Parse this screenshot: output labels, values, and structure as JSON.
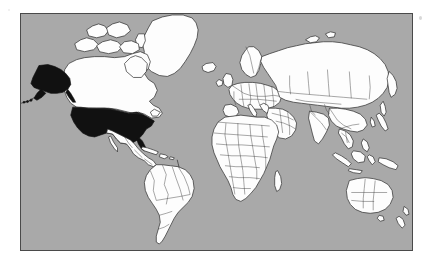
{
  "figure": {
    "type": "world-map",
    "projection": "Mercator",
    "page_background": "#ffffff",
    "frame": {
      "border_color": "#4a4a4a",
      "border_width_px": 1.5,
      "x": 20,
      "y": 13,
      "width": 393,
      "height": 238
    },
    "colors": {
      "ocean": "#a9a9a9",
      "land": "#fdfdfd",
      "land_outline": "#2a2a2a",
      "country_border": "#3a3a3a",
      "highlight_fill": "#111111"
    },
    "legend_present": false,
    "labels_present": false,
    "graticule": false
  },
  "highlighted": {
    "name": "United States",
    "fill": "#111111",
    "regions": [
      "Contiguous United States",
      "Alaska",
      "Aleutian Islands"
    ]
  },
  "regions": [
    {
      "id": "greenland",
      "name": "Greenland",
      "highlighted": false
    },
    {
      "id": "canada",
      "name": "Canada",
      "highlighted": false
    },
    {
      "id": "usa-mainland",
      "name": "United States",
      "highlighted": true
    },
    {
      "id": "alaska",
      "name": "Alaska",
      "highlighted": true
    },
    {
      "id": "aleutians",
      "name": "Aleutian Islands",
      "highlighted": true
    },
    {
      "id": "mexico-centralamerica",
      "name": "Mexico and Central America",
      "highlighted": false
    },
    {
      "id": "caribbean",
      "name": "Caribbean Islands",
      "highlighted": false
    },
    {
      "id": "south-america",
      "name": "South America",
      "highlighted": false
    },
    {
      "id": "iceland",
      "name": "Iceland",
      "highlighted": false
    },
    {
      "id": "europe",
      "name": "Europe",
      "highlighted": false
    },
    {
      "id": "africa",
      "name": "Africa",
      "highlighted": false
    },
    {
      "id": "madagascar",
      "name": "Madagascar",
      "highlighted": false
    },
    {
      "id": "middle-east",
      "name": "Middle East",
      "highlighted": false
    },
    {
      "id": "russia-asia",
      "name": "Russia and Asia",
      "highlighted": false
    },
    {
      "id": "india",
      "name": "India",
      "highlighted": false
    },
    {
      "id": "china",
      "name": "China",
      "highlighted": false
    },
    {
      "id": "japan",
      "name": "Japan",
      "highlighted": false
    },
    {
      "id": "indonesia",
      "name": "Indonesia and Philippines",
      "highlighted": false
    },
    {
      "id": "new-guinea",
      "name": "New Guinea",
      "highlighted": false
    },
    {
      "id": "australia",
      "name": "Australia",
      "highlighted": false
    },
    {
      "id": "new-zealand",
      "name": "New Zealand",
      "highlighted": false
    }
  ],
  "artifacts": [
    {
      "id": "speck-top-right",
      "kind": "scan-speck"
    },
    {
      "id": "speck-top-left",
      "kind": "scan-speck"
    }
  ]
}
